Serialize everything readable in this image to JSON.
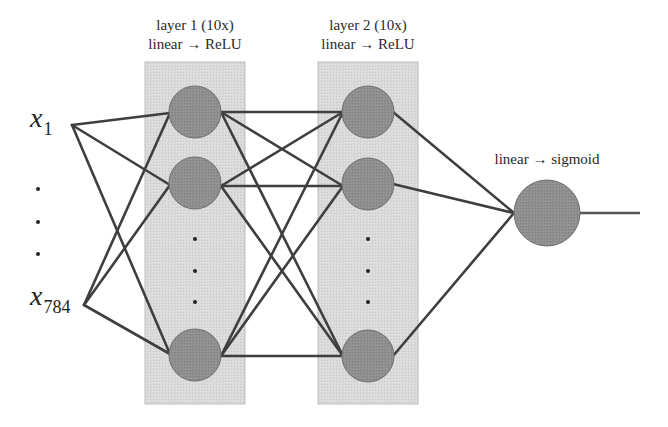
{
  "colors": {
    "box_fill": "#d9d9d9",
    "box_stroke": "#bdbdbd",
    "node_fill": "#8e8e8e",
    "node_stroke": "#6e6e6e",
    "edge": "#3f3f3f",
    "text": "#2a2a2a"
  },
  "inputs": {
    "first": {
      "base": "x",
      "sub": "1"
    },
    "last": {
      "base": "x",
      "sub": "784"
    },
    "ellipsis_dots": 3
  },
  "layers": [
    {
      "title": "layer 1 (10x)",
      "activation": "linear → ReLU",
      "visible_nodes": 3,
      "ellipsis_dots": 3
    },
    {
      "title": "layer 2 (10x)",
      "activation": "linear → ReLU",
      "visible_nodes": 3,
      "ellipsis_dots": 3
    }
  ],
  "output": {
    "activation": "linear → sigmoid",
    "nodes": 1
  }
}
